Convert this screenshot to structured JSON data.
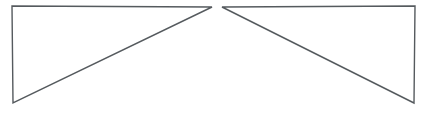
{
  "canvas": {
    "width": 444,
    "height": 120,
    "background_color": "#ffffff"
  },
  "style": {
    "stroke_color": "#555a5e",
    "stroke_width": 1.4,
    "fill": "none"
  },
  "figure": {
    "kind": "geometric-line-drawing",
    "shape_count": 2
  },
  "shapes": [
    {
      "name": "left-triangle",
      "type": "right-triangle",
      "orientation": "right-angle-at-top-left",
      "mirror_of": "right-triangle",
      "points": "12,6 212,7 13,103",
      "vertices": [
        {
          "label": "top-left",
          "x": 12,
          "y": 6
        },
        {
          "label": "apex-right",
          "x": 212,
          "y": 7
        },
        {
          "label": "bottom-left",
          "x": 13,
          "y": 103
        }
      ],
      "edges": [
        {
          "label": "top-horizontal",
          "from": "top-left",
          "to": "apex-right"
        },
        {
          "label": "hypotenuse",
          "from": "apex-right",
          "to": "bottom-left"
        },
        {
          "label": "left-vertical",
          "from": "bottom-left",
          "to": "top-left"
        }
      ]
    },
    {
      "name": "right-triangle",
      "type": "right-triangle",
      "orientation": "right-angle-at-top-right",
      "mirror_of": "left-triangle",
      "points": "222,7 415,6 414,103",
      "vertices": [
        {
          "label": "apex-left",
          "x": 222,
          "y": 7
        },
        {
          "label": "top-right",
          "x": 415,
          "y": 6
        },
        {
          "label": "bottom-right",
          "x": 414,
          "y": 103
        }
      ],
      "edges": [
        {
          "label": "top-horizontal",
          "from": "apex-left",
          "to": "top-right"
        },
        {
          "label": "right-vertical",
          "from": "top-right",
          "to": "bottom-right"
        },
        {
          "label": "hypotenuse",
          "from": "bottom-right",
          "to": "apex-left"
        }
      ]
    }
  ],
  "gap": {
    "name": "central-gap",
    "start_x": 212,
    "end_x": 222,
    "width": 10
  }
}
